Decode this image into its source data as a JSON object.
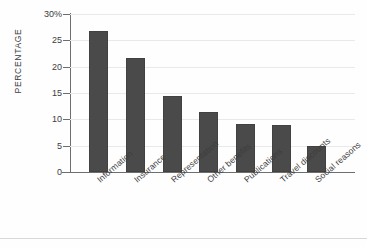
{
  "chart_data": {
    "type": "bar",
    "title": "",
    "xlabel": "",
    "ylabel": "PERCENTAGE",
    "categories": [
      "Information",
      "Insurance",
      "Representation",
      "Other benefits",
      "Publications",
      "Travel discounts",
      "Social reasons"
    ],
    "values": [
      26.8,
      21.7,
      14.5,
      11.4,
      9.2,
      9.0,
      4.9
    ],
    "ylim": [
      0,
      30
    ],
    "ytick_labels": [
      "30%",
      "25",
      "20",
      "15",
      "10",
      "5",
      "0"
    ],
    "ytick_values": [
      30,
      25,
      20,
      15,
      10,
      5,
      0
    ],
    "grid": true,
    "legend": "none",
    "bar_color": "#4a4a4a",
    "grid_color": "#e9e9e9",
    "axis_color": "#6e6e6e",
    "background": "#fefefe"
  }
}
